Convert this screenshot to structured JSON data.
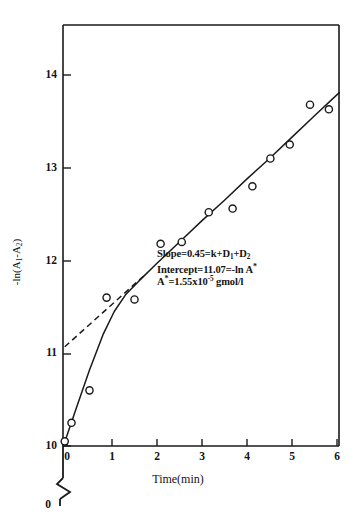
{
  "chart_data": {
    "type": "scatter",
    "title": "",
    "xlabel": "Time(min)",
    "ylabel": "-ln(A1-A2)",
    "ylabel_parts": {
      "prefix": "-ln(A",
      "sub1": "1",
      "mid": "-A",
      "sub2": "2",
      "suffix": ")"
    },
    "xlim": [
      -0.25,
      6.2
    ],
    "ylim": [
      9.95,
      14.3
    ],
    "xticks": [
      "0",
      "1",
      "2",
      "3",
      "4",
      "5",
      "6"
    ],
    "xtick_values": [
      0,
      1,
      2,
      3,
      4,
      5,
      6
    ],
    "yticks": [
      "10",
      "11",
      "12",
      "13",
      "14"
    ],
    "ytick_values": [
      10,
      11,
      12,
      13,
      14
    ],
    "grid": false,
    "legend": "none",
    "axis_break_label": "0",
    "points": [
      {
        "x": -0.05,
        "y": 10.05
      },
      {
        "x": 0.1,
        "y": 10.25
      },
      {
        "x": 0.5,
        "y": 10.6
      },
      {
        "x": 0.88,
        "y": 11.6
      },
      {
        "x": 1.5,
        "y": 11.58
      },
      {
        "x": 2.08,
        "y": 12.18
      },
      {
        "x": 2.55,
        "y": 12.2
      },
      {
        "x": 3.15,
        "y": 12.52
      },
      {
        "x": 3.68,
        "y": 12.56
      },
      {
        "x": 4.12,
        "y": 12.8
      },
      {
        "x": 4.52,
        "y": 13.1
      },
      {
        "x": 4.95,
        "y": 13.25
      },
      {
        "x": 5.4,
        "y": 13.68
      },
      {
        "x": 5.82,
        "y": 13.63
      }
    ],
    "fit_curve": [
      {
        "x": -0.08,
        "y": 10.0
      },
      {
        "x": 0.2,
        "y": 10.4
      },
      {
        "x": 0.5,
        "y": 10.82
      },
      {
        "x": 0.8,
        "y": 11.2
      },
      {
        "x": 1.05,
        "y": 11.45
      },
      {
        "x": 1.3,
        "y": 11.63
      },
      {
        "x": 1.6,
        "y": 11.78
      },
      {
        "x": 2.0,
        "y": 11.97
      },
      {
        "x": 2.5,
        "y": 12.2
      },
      {
        "x": 3.0,
        "y": 12.43
      },
      {
        "x": 3.5,
        "y": 12.65
      },
      {
        "x": 4.0,
        "y": 12.88
      },
      {
        "x": 4.5,
        "y": 13.1
      },
      {
        "x": 5.0,
        "y": 13.33
      },
      {
        "x": 5.5,
        "y": 13.56
      },
      {
        "x": 6.05,
        "y": 13.81
      }
    ],
    "dashed_line": {
      "description": "extrapolated linear fit to intercept",
      "x0": -0.05,
      "y0": 11.07,
      "x1": 1.72,
      "y1": 11.84
    },
    "annotations": {
      "line1": {
        "label": "Slope",
        "eq1": "=0.45=k+D",
        "sub1": "1",
        "plus": "+D",
        "sub2": "2"
      },
      "line2": {
        "label": "Intercept",
        "eq": "=11.07=-ln A",
        "star": "*"
      },
      "line3": {
        "label": "A",
        "star": "*",
        "eq": "=1.55x10",
        "exp": "-5",
        "units": " gmol/l"
      }
    },
    "slope": 0.45,
    "intercept": 11.07,
    "a_star": "1.55x10^-5 gmol/l"
  }
}
